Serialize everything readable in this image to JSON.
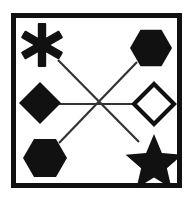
{
  "figure": {
    "title": "Geometric shapes connected by crossing lines",
    "type": "line-drawing",
    "canvas": {
      "width": 193,
      "height": 201
    },
    "colors": {
      "background": "#ffffff",
      "ink": "#111111",
      "frame": "#111111",
      "line": "#333333"
    },
    "frame": {
      "name": "outer-border-rectangle",
      "x": 11,
      "y": 13,
      "width": 171,
      "height": 175,
      "stroke_width": 5,
      "fill": "none"
    },
    "shapes": [
      {
        "id": "asterisk",
        "label": "six-pointed asterisk burst",
        "position": "top-left",
        "fill": "solid-black",
        "cx": 42,
        "cy": 45,
        "radius": 22,
        "points": 6
      },
      {
        "id": "hexagon-top-right",
        "label": "filled hexagon",
        "position": "top-right",
        "fill": "solid-black",
        "cx": 151,
        "cy": 48,
        "radius": 21,
        "orientation": "pointy-side"
      },
      {
        "id": "diamond-left",
        "label": "filled diamond",
        "position": "middle-left",
        "fill": "solid-black",
        "cx": 40,
        "cy": 103,
        "radius": 21
      },
      {
        "id": "diamond-right",
        "label": "outlined diamond",
        "position": "middle-right",
        "fill": "none",
        "cx": 154,
        "cy": 104,
        "radius": 21,
        "stroke_width": 4
      },
      {
        "id": "hexagon-bottom-left",
        "label": "filled hexagon",
        "position": "bottom-left",
        "fill": "solid-black",
        "cx": 45,
        "cy": 158,
        "radius": 22,
        "orientation": "pointy-side"
      },
      {
        "id": "star-bottom-right",
        "label": "filled five-pointed star",
        "position": "bottom-right",
        "fill": "solid-black",
        "cx": 154,
        "cy": 160,
        "radius": 26,
        "points": 5
      }
    ],
    "connectors": [
      {
        "id": "line-horizontal",
        "label": "horizontal connector between the two diamonds",
        "x1": 57,
        "y1": 104,
        "x2": 137,
        "y2": 104,
        "stroke_width": 2
      },
      {
        "id": "line-diagonal-nw-se",
        "label": "diagonal connector from asterisk to star",
        "x1": 58,
        "y1": 60,
        "x2": 139,
        "y2": 142,
        "stroke_width": 2
      },
      {
        "id": "line-diagonal-ne-sw",
        "label": "diagonal connector from top-right hexagon to bottom-left hexagon",
        "x1": 137,
        "y1": 62,
        "x2": 59,
        "y2": 143,
        "stroke_width": 2
      }
    ],
    "intersection": {
      "label": "center crossing point",
      "x": 97,
      "y": 104
    }
  }
}
